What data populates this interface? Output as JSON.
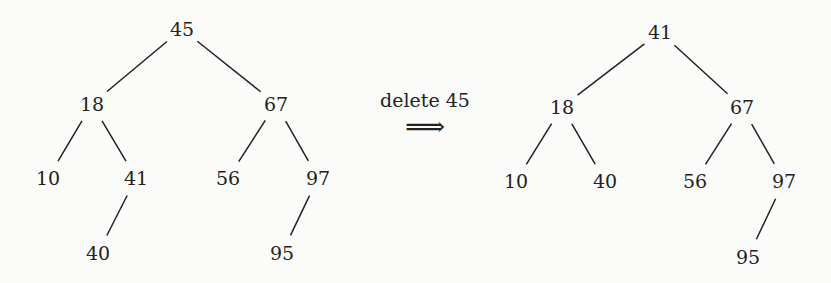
{
  "operation": {
    "label": "delete 45",
    "arrow_glyph": "⟹"
  },
  "before_tree": {
    "nodes": [
      {
        "id": "45",
        "label": "45",
        "x": 182,
        "y": 29
      },
      {
        "id": "18",
        "label": "18",
        "x": 92,
        "y": 104
      },
      {
        "id": "67",
        "label": "67",
        "x": 276,
        "y": 104
      },
      {
        "id": "10",
        "label": "10",
        "x": 48,
        "y": 178
      },
      {
        "id": "41",
        "label": "41",
        "x": 136,
        "y": 178
      },
      {
        "id": "56",
        "label": "56",
        "x": 228,
        "y": 178
      },
      {
        "id": "97",
        "label": "97",
        "x": 318,
        "y": 178
      },
      {
        "id": "40",
        "label": "40",
        "x": 98,
        "y": 253
      },
      {
        "id": "95",
        "label": "95",
        "x": 282,
        "y": 253
      }
    ],
    "edges": [
      [
        "45",
        "18"
      ],
      [
        "45",
        "67"
      ],
      [
        "18",
        "10"
      ],
      [
        "18",
        "41"
      ],
      [
        "67",
        "56"
      ],
      [
        "67",
        "97"
      ],
      [
        "41",
        "40"
      ],
      [
        "97",
        "95"
      ]
    ]
  },
  "after_tree": {
    "nodes": [
      {
        "id": "41",
        "label": "41",
        "x": 660,
        "y": 32
      },
      {
        "id": "18",
        "label": "18",
        "x": 562,
        "y": 107
      },
      {
        "id": "67",
        "label": "67",
        "x": 742,
        "y": 107
      },
      {
        "id": "10",
        "label": "10",
        "x": 516,
        "y": 181
      },
      {
        "id": "40",
        "label": "40",
        "x": 605,
        "y": 181
      },
      {
        "id": "56",
        "label": "56",
        "x": 695,
        "y": 181
      },
      {
        "id": "97",
        "label": "97",
        "x": 784,
        "y": 181
      },
      {
        "id": "95",
        "label": "95",
        "x": 748,
        "y": 257
      }
    ],
    "edges": [
      [
        "41",
        "18"
      ],
      [
        "41",
        "67"
      ],
      [
        "18",
        "10"
      ],
      [
        "18",
        "40"
      ],
      [
        "67",
        "56"
      ],
      [
        "67",
        "97"
      ],
      [
        "97",
        "95"
      ]
    ]
  }
}
